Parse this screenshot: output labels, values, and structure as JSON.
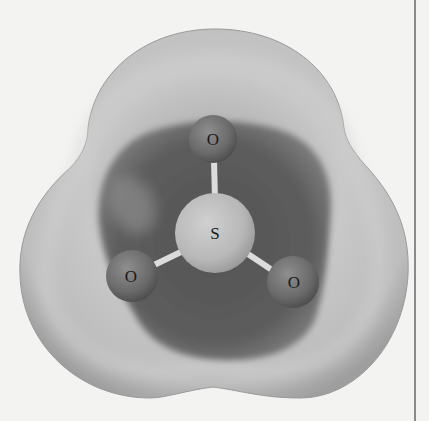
{
  "figure": {
    "molecule": "SO3",
    "atoms": [
      {
        "id": "O1",
        "label": "O",
        "cx": 213,
        "cy": 139,
        "r": 24
      },
      {
        "id": "S",
        "label": "S",
        "cx": 215,
        "cy": 233,
        "r": 40
      },
      {
        "id": "O2",
        "label": "O",
        "cx": 132,
        "cy": 276,
        "r": 26
      },
      {
        "id": "O3",
        "label": "O",
        "cx": 293,
        "cy": 282,
        "r": 26
      }
    ],
    "colors": {
      "page_background": "#f3f3f1",
      "outer_shell_light": "#c4c4c4",
      "outer_shell_edge": "#9a9a9a",
      "inner_region_dark": "#5a5a5a",
      "sulfur_atom": "#bdbdbd",
      "oxygen_atom": "#6e6e6e",
      "bond": "#dcdcdc",
      "column_rule": "#8a8a8a"
    }
  }
}
